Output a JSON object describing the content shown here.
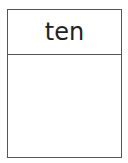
{
  "card": {
    "title": "ten",
    "body_text": ""
  },
  "colors": {
    "border": "#555555",
    "text": "#222222",
    "background": "#ffffff"
  }
}
